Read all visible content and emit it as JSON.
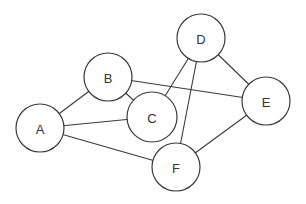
{
  "diagram": {
    "type": "undirected-graph",
    "stroke_color": "#3a3a3a",
    "node_fill": "#ffffff",
    "label_color": "#333333",
    "nodes": [
      {
        "id": "A",
        "label": "A",
        "x": 40,
        "y": 128,
        "r": 24
      },
      {
        "id": "B",
        "label": "B",
        "x": 108,
        "y": 77,
        "r": 24
      },
      {
        "id": "C",
        "label": "C",
        "x": 152,
        "y": 117,
        "r": 25
      },
      {
        "id": "D",
        "label": "D",
        "x": 201,
        "y": 38,
        "r": 24
      },
      {
        "id": "E",
        "label": "E",
        "x": 266,
        "y": 101,
        "r": 24
      },
      {
        "id": "F",
        "label": "F",
        "x": 176,
        "y": 167,
        "r": 24
      }
    ],
    "edges": [
      {
        "from": "A",
        "to": "B"
      },
      {
        "from": "A",
        "to": "C"
      },
      {
        "from": "A",
        "to": "F"
      },
      {
        "from": "B",
        "to": "C"
      },
      {
        "from": "B",
        "to": "E"
      },
      {
        "from": "C",
        "to": "D"
      },
      {
        "from": "D",
        "to": "E"
      },
      {
        "from": "D",
        "to": "F"
      },
      {
        "from": "E",
        "to": "F"
      }
    ]
  }
}
